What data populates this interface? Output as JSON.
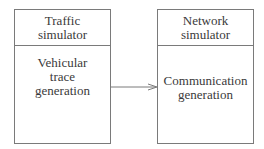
{
  "diagram": {
    "type": "block-diagram",
    "nodes": [
      {
        "id": "traffic-simulator",
        "header_lines": [
          "Traffic",
          "simulator"
        ],
        "body_lines": [
          "Vehicular",
          "trace",
          "generation"
        ]
      },
      {
        "id": "network-simulator",
        "header_lines": [
          "Network",
          "simulator"
        ],
        "body_lines": [
          "Communication",
          "generation"
        ]
      }
    ],
    "edges": [
      {
        "from": "traffic-simulator",
        "to": "network-simulator",
        "style": "arrow"
      }
    ],
    "colors": {
      "border": "#7a7a7a",
      "text": "#3a3a3a",
      "background": "#ffffff"
    }
  }
}
